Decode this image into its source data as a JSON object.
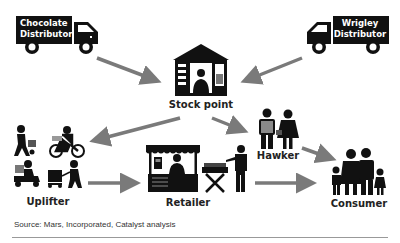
{
  "nodes": {
    "chocolate_distributor": {
      "line1": "Chocolate",
      "line2": "Distributor"
    },
    "wrigley_distributor": {
      "line1": "Wrigley",
      "line2": "Distributor"
    },
    "stock_point": {
      "label": "Stock point"
    },
    "hawker": {
      "label": "Hawker"
    },
    "uplifter": {
      "label": "Uplifter"
    },
    "retailer": {
      "label": "Retailer"
    },
    "consumer": {
      "label": "Consumer"
    }
  },
  "edges": [
    {
      "from": "Chocolate Distributor",
      "to": "Stock point"
    },
    {
      "from": "Wrigley Distributor",
      "to": "Stock point"
    },
    {
      "from": "Stock point",
      "to": "Uplifter"
    },
    {
      "from": "Stock point",
      "to": "Hawker"
    },
    {
      "from": "Uplifter",
      "to": "Retailer"
    },
    {
      "from": "Retailer",
      "to": "Consumer"
    },
    {
      "from": "Hawker",
      "to": "Consumer"
    }
  ],
  "colors": {
    "arrow": "#7a7a7a",
    "icon": "#111111",
    "icon_gray": "#8a8a8a"
  },
  "footer": {
    "source": "Source: Mars, Incorporated, Catalyst analysis"
  }
}
